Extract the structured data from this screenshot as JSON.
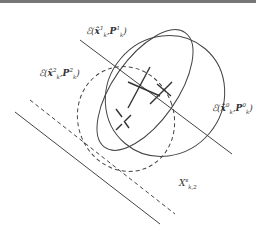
{
  "figure": {
    "type": "ellipsoid-intersection-diagram",
    "colors": {
      "line": "#444444",
      "topbar": "#777777",
      "background": "#ffffff"
    },
    "labels": {
      "ellipse1": {
        "script": "ℰ",
        "state": "x̂",
        "state_sup": "1",
        "state_sub": "k",
        "cov": "P",
        "cov_sup": "1",
        "cov_sub": "k",
        "text": "ℰ(x̂¹ₖ, P¹ₖ)"
      },
      "ellipse2": {
        "script": "ℰ",
        "state": "x̂",
        "state_sup": "2",
        "state_sub": "k",
        "cov": "P",
        "cov_sup": "2",
        "cov_sub": "k",
        "text": "ℰ(x̂²ₖ, P²ₖ)"
      },
      "ellipse0": {
        "script": "ℰ",
        "state": "x̂",
        "state_sup": "0",
        "state_sub": "k",
        "cov": "P",
        "cov_sup": "0",
        "cov_sub": "k",
        "text": "ℰ(x̂⁰ₖ, P⁰ₖ)"
      },
      "strip": {
        "symbol": "X",
        "sup": "s",
        "sub": "k,2",
        "text": "Xˢₖ,₂"
      }
    },
    "elements": {
      "ellipses_solid": 2,
      "ellipses_dashed": 1,
      "lines_solid": 2,
      "lines_dashed": 1,
      "center_crosses_solid": 2,
      "center_crosses_dashed": 1
    }
  }
}
